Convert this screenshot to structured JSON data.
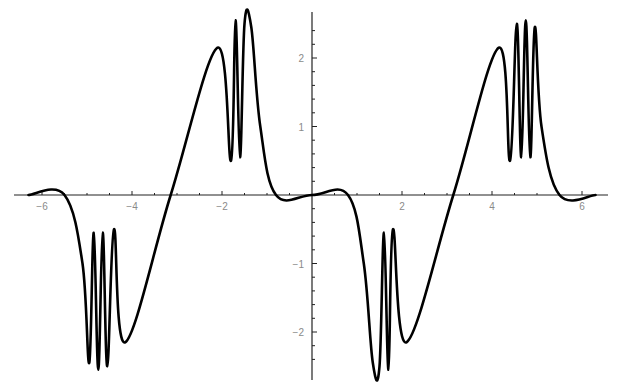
{
  "chart_data": {
    "type": "line",
    "title": "",
    "xlabel": "",
    "ylabel": "",
    "xlim": [
      -6.3,
      6.3
    ],
    "ylim": [
      -2.6,
      2.6
    ],
    "grid": false,
    "legend": null,
    "x_ticks": [
      -6,
      -4,
      -2,
      2,
      4,
      6
    ],
    "x_tick_labels": [
      "-6",
      "-4",
      "-2",
      "2",
      "4",
      "6"
    ],
    "y_ticks": [
      -2,
      -1,
      1,
      2
    ],
    "y_tick_labels": [
      "-2",
      "-1",
      "1",
      "2"
    ],
    "series": [
      {
        "name": "f(x)",
        "color": "#000000",
        "key_points": [
          {
            "x": -6.3,
            "y": 0.0
          },
          {
            "x": -5.5,
            "y": 0.0
          },
          {
            "x": -5.1,
            "y": -1.0
          },
          {
            "x": -4.95,
            "y": -2.45
          },
          {
            "x": -4.85,
            "y": -0.55
          },
          {
            "x": -4.75,
            "y": -2.55
          },
          {
            "x": -4.65,
            "y": -0.55
          },
          {
            "x": -4.55,
            "y": -2.5
          },
          {
            "x": -4.4,
            "y": -0.5
          },
          {
            "x": -4.15,
            "y": -2.15
          },
          {
            "x": -3.14,
            "y": 0.0
          },
          {
            "x": -2.1,
            "y": 2.15
          },
          {
            "x": -1.8,
            "y": 0.5
          },
          {
            "x": -1.7,
            "y": 2.55
          },
          {
            "x": -1.6,
            "y": 0.55
          },
          {
            "x": -1.5,
            "y": 2.5
          },
          {
            "x": -1.35,
            "y": 2.45
          },
          {
            "x": -1.15,
            "y": 1.0
          },
          {
            "x": -0.8,
            "y": 0.0
          },
          {
            "x": 0.0,
            "y": 0.0
          },
          {
            "x": 0.8,
            "y": 0.0
          },
          {
            "x": 1.15,
            "y": -1.0
          },
          {
            "x": 1.35,
            "y": -2.45
          },
          {
            "x": 1.5,
            "y": -2.5
          },
          {
            "x": 1.6,
            "y": -0.55
          },
          {
            "x": 1.7,
            "y": -2.55
          },
          {
            "x": 1.8,
            "y": -0.5
          },
          {
            "x": 2.1,
            "y": -2.15
          },
          {
            "x": 3.14,
            "y": 0.0
          },
          {
            "x": 4.15,
            "y": 2.15
          },
          {
            "x": 4.4,
            "y": 0.5
          },
          {
            "x": 4.55,
            "y": 2.5
          },
          {
            "x": 4.65,
            "y": 0.55
          },
          {
            "x": 4.75,
            "y": 2.55
          },
          {
            "x": 4.85,
            "y": 0.55
          },
          {
            "x": 4.95,
            "y": 2.45
          },
          {
            "x": 5.1,
            "y": 1.0
          },
          {
            "x": 5.5,
            "y": 0.0
          },
          {
            "x": 6.3,
            "y": 0.0
          }
        ]
      }
    ]
  },
  "layout": {
    "origin_px": [
      312,
      195
    ],
    "x_px_per_unit": 45,
    "y_px_per_unit": 68.5,
    "x_axis_px": [
      14,
      608
    ],
    "y_axis_px": [
      12,
      380
    ],
    "axis_color": "#222222",
    "label_color": "#8a8a8a",
    "curve_color": "#000000"
  }
}
